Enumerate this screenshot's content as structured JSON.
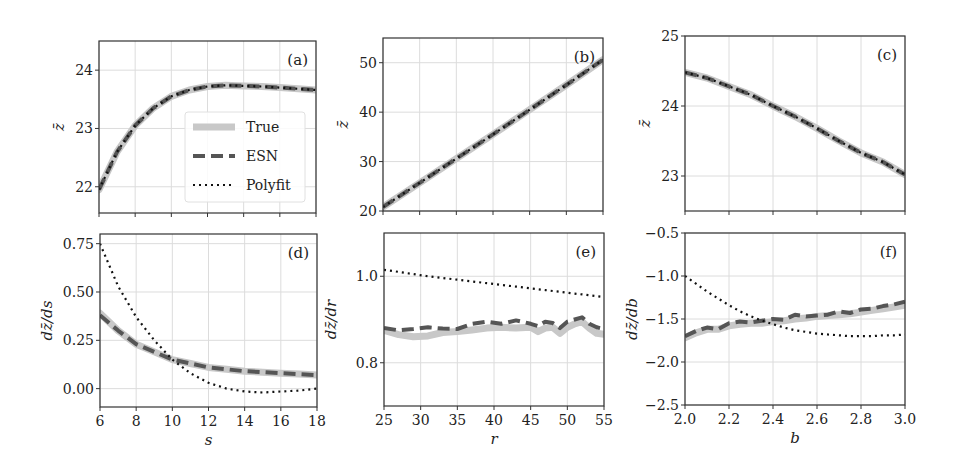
{
  "figure": {
    "legend": {
      "panel": "a",
      "entries": [
        {
          "label": "True",
          "style": "solid",
          "color": "#c8c8c8",
          "width": 7
        },
        {
          "label": "ESN",
          "style": "dashed",
          "color": "#555555",
          "width": 4
        },
        {
          "label": "Polyfit",
          "style": "dotted",
          "color": "#111111",
          "width": 2
        }
      ]
    },
    "colors": {
      "true": "#c8c8c8",
      "esn": "#555555",
      "polyfit": "#111111",
      "grid": "#dcdcdc",
      "frame": "#333333"
    }
  },
  "chart_data": [
    {
      "id": "a",
      "tag": "(a)",
      "type": "line",
      "xlabel": "",
      "ylabel": "z̄",
      "xlim": [
        6,
        18
      ],
      "ylim": [
        21.55,
        24.5
      ],
      "xticks": [
        6,
        8,
        10,
        12,
        14,
        16,
        18
      ],
      "xticklabels": [],
      "yticks": [
        22,
        23,
        24
      ],
      "yticklabels": [
        "22",
        "23",
        "24"
      ],
      "grid": true,
      "x": [
        6,
        7,
        8,
        9,
        10,
        11,
        12,
        13,
        14,
        15,
        16,
        17,
        18
      ],
      "series": [
        {
          "name": "True",
          "values": [
            21.95,
            22.6,
            23.05,
            23.35,
            23.55,
            23.66,
            23.72,
            23.74,
            23.73,
            23.72,
            23.7,
            23.68,
            23.66
          ]
        },
        {
          "name": "ESN",
          "values": [
            21.95,
            22.6,
            23.05,
            23.35,
            23.55,
            23.66,
            23.72,
            23.74,
            23.73,
            23.72,
            23.7,
            23.68,
            23.66
          ]
        },
        {
          "name": "Polyfit",
          "values": [
            21.95,
            22.6,
            23.05,
            23.35,
            23.55,
            23.66,
            23.72,
            23.74,
            23.73,
            23.72,
            23.7,
            23.68,
            23.66
          ]
        }
      ]
    },
    {
      "id": "b",
      "tag": "(b)",
      "type": "line",
      "xlabel": "",
      "ylabel": "z̄",
      "xlim": [
        25,
        55
      ],
      "ylim": [
        20,
        55
      ],
      "xticks": [
        25,
        30,
        35,
        40,
        45,
        50,
        55
      ],
      "xticklabels": [],
      "yticks": [
        20,
        30,
        40,
        50
      ],
      "yticklabels": [
        "20",
        "30",
        "40",
        "50"
      ],
      "grid": true,
      "x": [
        25,
        30,
        35,
        40,
        45,
        50,
        55
      ],
      "series": [
        {
          "name": "True",
          "values": [
            20.8,
            25.7,
            30.6,
            35.5,
            40.5,
            45.5,
            50.6
          ]
        },
        {
          "name": "ESN",
          "values": [
            20.8,
            25.7,
            30.6,
            35.5,
            40.5,
            45.5,
            50.6
          ]
        },
        {
          "name": "Polyfit",
          "values": [
            20.8,
            25.7,
            30.6,
            35.5,
            40.5,
            45.5,
            50.6
          ]
        }
      ]
    },
    {
      "id": "c",
      "tag": "(c)",
      "type": "line",
      "xlabel": "",
      "ylabel": "z̄",
      "xlim": [
        2.0,
        3.0
      ],
      "ylim": [
        22.5,
        25
      ],
      "xticks": [
        2.0,
        2.2,
        2.4,
        2.6,
        2.8,
        3.0
      ],
      "xticklabels": [],
      "yticks": [
        23,
        24,
        25
      ],
      "yticklabels": [
        "23",
        "24",
        "25"
      ],
      "grid": true,
      "x": [
        2.0,
        2.1,
        2.2,
        2.3,
        2.4,
        2.5,
        2.6,
        2.7,
        2.8,
        2.9,
        3.0
      ],
      "series": [
        {
          "name": "True",
          "values": [
            24.48,
            24.4,
            24.28,
            24.16,
            24.0,
            23.85,
            23.68,
            23.5,
            23.33,
            23.2,
            23.02
          ]
        },
        {
          "name": "ESN",
          "values": [
            24.48,
            24.4,
            24.28,
            24.16,
            24.0,
            23.85,
            23.68,
            23.5,
            23.33,
            23.2,
            23.02
          ]
        },
        {
          "name": "Polyfit",
          "values": [
            24.48,
            24.4,
            24.28,
            24.16,
            24.0,
            23.85,
            23.68,
            23.5,
            23.33,
            23.2,
            23.02
          ]
        }
      ]
    },
    {
      "id": "d",
      "tag": "(d)",
      "type": "line",
      "xlabel": "s",
      "ylabel": "dz̄/ds",
      "xlim": [
        6,
        18
      ],
      "ylim": [
        -0.095,
        0.8
      ],
      "xticks": [
        6,
        8,
        10,
        12,
        14,
        16,
        18
      ],
      "xticklabels": [
        "6",
        "8",
        "10",
        "12",
        "14",
        "16",
        "18"
      ],
      "yticks": [
        0.0,
        0.25,
        0.5,
        0.75
      ],
      "yticklabels": [
        "0.00",
        "0.25",
        "0.50",
        "0.75"
      ],
      "grid": true,
      "x": [
        6,
        7,
        8,
        9,
        10,
        11,
        12,
        13,
        14,
        15,
        16,
        17,
        18
      ],
      "series": [
        {
          "name": "True",
          "values": [
            0.39,
            0.3,
            0.23,
            0.19,
            0.15,
            0.13,
            0.11,
            0.1,
            0.09,
            0.085,
            0.08,
            0.075,
            0.07
          ]
        },
        {
          "name": "ESN",
          "values": [
            0.38,
            0.3,
            0.23,
            0.19,
            0.15,
            0.13,
            0.11,
            0.1,
            0.09,
            0.085,
            0.08,
            0.075,
            0.07
          ]
        },
        {
          "name": "Polyfit",
          "values": [
            0.75,
            0.53,
            0.37,
            0.25,
            0.15,
            0.08,
            0.03,
            0.0,
            -0.015,
            -0.02,
            -0.015,
            -0.01,
            0.0
          ]
        }
      ]
    },
    {
      "id": "e",
      "tag": "(e)",
      "type": "line",
      "xlabel": "r",
      "ylabel": "dz̄/dr",
      "xlim": [
        25,
        55
      ],
      "ylim": [
        0.7,
        1.1
      ],
      "xticks": [
        25,
        30,
        35,
        40,
        45,
        50,
        55
      ],
      "xticklabels": [
        "25",
        "30",
        "35",
        "40",
        "45",
        "50",
        "55"
      ],
      "yticks": [
        0.8,
        1.0
      ],
      "yticklabels": [
        "0.8",
        "1.0"
      ],
      "grid": true,
      "x": [
        25,
        27,
        29,
        31,
        33,
        35,
        37,
        39,
        41,
        43,
        45,
        46,
        47,
        48,
        49,
        50,
        51,
        52,
        53,
        54,
        55
      ],
      "series": [
        {
          "name": "True",
          "values": [
            0.875,
            0.865,
            0.86,
            0.862,
            0.87,
            0.872,
            0.876,
            0.88,
            0.882,
            0.88,
            0.882,
            0.872,
            0.88,
            0.882,
            0.868,
            0.882,
            0.89,
            0.895,
            0.88,
            0.868,
            0.866
          ]
        },
        {
          "name": "ESN",
          "values": [
            0.88,
            0.875,
            0.878,
            0.882,
            0.879,
            0.878,
            0.89,
            0.895,
            0.89,
            0.898,
            0.89,
            0.885,
            0.895,
            0.892,
            0.88,
            0.895,
            0.9,
            0.905,
            0.89,
            0.882,
            0.878
          ]
        },
        {
          "name": "Polyfit",
          "values": [
            1.015,
            1.01,
            1.005,
            1.0,
            0.996,
            0.992,
            0.988,
            0.984,
            0.98,
            0.976,
            0.972,
            0.97,
            0.968,
            0.966,
            0.964,
            0.962,
            0.96,
            0.958,
            0.956,
            0.954,
            0.952
          ]
        }
      ]
    },
    {
      "id": "f",
      "tag": "(f)",
      "type": "line",
      "xlabel": "b",
      "ylabel": "dz̄/db",
      "xlim": [
        2.0,
        3.0
      ],
      "ylim": [
        -2.5,
        -0.5
      ],
      "xticks": [
        2.0,
        2.2,
        2.4,
        2.6,
        2.8,
        3.0
      ],
      "xticklabels": [
        "2.0",
        "2.2",
        "2.4",
        "2.6",
        "2.8",
        "3.0"
      ],
      "yticks": [
        -2.5,
        -2.0,
        -1.5,
        -1.0,
        -0.5
      ],
      "yticklabels": [
        "−2.5",
        "−2.0",
        "−1.5",
        "−1.0",
        "−0.5"
      ],
      "grid": true,
      "x": [
        2.0,
        2.05,
        2.1,
        2.15,
        2.2,
        2.25,
        2.3,
        2.35,
        2.4,
        2.45,
        2.5,
        2.55,
        2.6,
        2.65,
        2.7,
        2.75,
        2.8,
        2.85,
        2.9,
        2.95,
        3.0
      ],
      "series": [
        {
          "name": "True",
          "values": [
            -1.72,
            -1.66,
            -1.62,
            -1.62,
            -1.58,
            -1.56,
            -1.55,
            -1.55,
            -1.53,
            -1.52,
            -1.5,
            -1.49,
            -1.47,
            -1.46,
            -1.45,
            -1.44,
            -1.42,
            -1.4,
            -1.38,
            -1.36,
            -1.34
          ]
        },
        {
          "name": "ESN",
          "values": [
            -1.7,
            -1.64,
            -1.6,
            -1.62,
            -1.55,
            -1.53,
            -1.54,
            -1.52,
            -1.5,
            -1.51,
            -1.45,
            -1.47,
            -1.46,
            -1.45,
            -1.41,
            -1.43,
            -1.39,
            -1.38,
            -1.35,
            -1.33,
            -1.3
          ]
        },
        {
          "name": "Polyfit",
          "values": [
            -1.0,
            -1.09,
            -1.18,
            -1.26,
            -1.34,
            -1.41,
            -1.47,
            -1.52,
            -1.56,
            -1.6,
            -1.63,
            -1.65,
            -1.67,
            -1.68,
            -1.69,
            -1.7,
            -1.7,
            -1.7,
            -1.69,
            -1.69,
            -1.68
          ]
        }
      ]
    }
  ]
}
